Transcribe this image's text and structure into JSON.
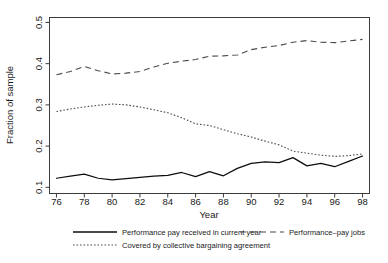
{
  "chart_data": {
    "type": "line",
    "title": "",
    "xlabel": "Year",
    "ylabel": "Fraction of sample",
    "xlim": [
      75.5,
      98.5
    ],
    "ylim": [
      0.085,
      0.512
    ],
    "grid": false,
    "legend_position": "bottom",
    "x": [
      76,
      77,
      78,
      79,
      80,
      81,
      82,
      83,
      84,
      85,
      86,
      87,
      88,
      89,
      90,
      91,
      92,
      93,
      94,
      95,
      96,
      97,
      98
    ],
    "xticks": [
      76,
      78,
      80,
      82,
      84,
      86,
      88,
      90,
      92,
      94,
      96,
      98
    ],
    "xtick_labels": [
      "76",
      "78",
      "80",
      "82",
      "84",
      "86",
      "88",
      "90",
      "92",
      "94",
      "96",
      "98"
    ],
    "yticks": [
      0.1,
      0.2,
      0.3,
      0.4,
      0.5
    ],
    "ytick_labels": [
      "0.1",
      "0.2",
      "0.3",
      "0.4",
      "0.5"
    ],
    "series": [
      {
        "name": "Performance pay received in current year",
        "style": "solid",
        "color": "#0d0d0d",
        "values": [
          0.122,
          0.127,
          0.132,
          0.122,
          0.118,
          0.121,
          0.124,
          0.127,
          0.129,
          0.136,
          0.126,
          0.138,
          0.128,
          0.146,
          0.158,
          0.162,
          0.16,
          0.172,
          0.152,
          0.158,
          0.15,
          0.163,
          0.176
        ]
      },
      {
        "name": "Performance–pay jobs",
        "style": "dashed",
        "color": "#4a4a4a",
        "values": [
          0.373,
          0.381,
          0.393,
          0.383,
          0.375,
          0.377,
          0.381,
          0.392,
          0.401,
          0.406,
          0.41,
          0.418,
          0.419,
          0.421,
          0.434,
          0.44,
          0.444,
          0.452,
          0.456,
          0.452,
          0.451,
          0.455,
          0.459
        ]
      },
      {
        "name": "Covered by collective bargaining agreement",
        "style": "dotted",
        "color": "#4a4a4a",
        "values": [
          0.284,
          0.29,
          0.295,
          0.299,
          0.302,
          0.3,
          0.295,
          0.288,
          0.281,
          0.269,
          0.254,
          0.25,
          0.24,
          0.23,
          0.222,
          0.212,
          0.203,
          0.188,
          0.183,
          0.178,
          0.175,
          0.177,
          0.181
        ]
      }
    ]
  },
  "legend": {
    "items": [
      {
        "label": "Performance pay received in current year",
        "style": "solid"
      },
      {
        "label": "Performance–pay jobs",
        "style": "dashed"
      },
      {
        "label": "Covered by collective bargaining agreement",
        "style": "dotted"
      }
    ]
  }
}
